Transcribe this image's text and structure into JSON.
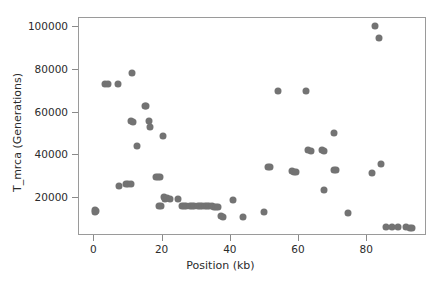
{
  "chart_data": {
    "type": "scatter",
    "title": "",
    "xlabel": "Position (kb)",
    "ylabel": "T_mrca (Generations)",
    "xlim": [
      -4.5,
      97.5
    ],
    "ylim": [
      2500,
      104000
    ],
    "xticks": [
      0,
      20,
      40,
      60,
      80
    ],
    "xticklabels": [
      "0",
      "20",
      "40",
      "60",
      "80"
    ],
    "yticks": [
      20000,
      40000,
      60000,
      80000,
      100000
    ],
    "yticklabels": [
      "20000",
      "40000",
      "60000",
      "80000",
      "100000"
    ],
    "grid": false,
    "legend": null,
    "marker_color": "#737373",
    "marker_size": 7,
    "series": [
      {
        "name": "T_mrca",
        "points": [
          [
            0.2,
            14800
          ],
          [
            0.3,
            13900
          ],
          [
            0.5,
            14200
          ],
          [
            3.2,
            73300
          ],
          [
            4.1,
            73200
          ],
          [
            6.8,
            73300
          ],
          [
            7.1,
            25800
          ],
          [
            9.4,
            26600
          ],
          [
            10.0,
            26700
          ],
          [
            10.6,
            26600
          ],
          [
            10.9,
            78300
          ],
          [
            10.8,
            55900
          ],
          [
            11.3,
            55700
          ],
          [
            12.6,
            44200
          ],
          [
            14.8,
            63200
          ],
          [
            15.1,
            62900
          ],
          [
            15.9,
            56200
          ],
          [
            16.4,
            53200
          ],
          [
            18.0,
            30000
          ],
          [
            18.6,
            29900
          ],
          [
            19.2,
            30000
          ],
          [
            19.0,
            16700
          ],
          [
            19.4,
            16500
          ],
          [
            20.2,
            49000
          ],
          [
            20.4,
            20700
          ],
          [
            20.6,
            19900
          ],
          [
            21.2,
            20000
          ],
          [
            22.2,
            19800
          ],
          [
            24.6,
            19900
          ],
          [
            25.6,
            16600
          ],
          [
            26.2,
            16500
          ],
          [
            26.8,
            16500
          ],
          [
            28.1,
            16400
          ],
          [
            28.7,
            16400
          ],
          [
            29.3,
            16400
          ],
          [
            30.4,
            16400
          ],
          [
            31.0,
            16300
          ],
          [
            31.6,
            16300
          ],
          [
            32.4,
            16300
          ],
          [
            33.0,
            16300
          ],
          [
            33.6,
            16300
          ],
          [
            34.4,
            16300
          ],
          [
            35.0,
            16200
          ],
          [
            35.6,
            16200
          ],
          [
            36.2,
            16200
          ],
          [
            37.1,
            11600
          ],
          [
            37.8,
            11500
          ],
          [
            40.6,
            19200
          ],
          [
            43.6,
            11400
          ],
          [
            49.6,
            13800
          ],
          [
            50.8,
            34700
          ],
          [
            51.6,
            34700
          ],
          [
            53.8,
            70200
          ],
          [
            57.9,
            32600
          ],
          [
            58.6,
            32500
          ],
          [
            59.2,
            32500
          ],
          [
            61.9,
            70100
          ],
          [
            62.6,
            42400
          ],
          [
            63.4,
            42200
          ],
          [
            66.7,
            42400
          ],
          [
            67.4,
            42300
          ],
          [
            67.2,
            24000
          ],
          [
            70.2,
            50600
          ],
          [
            70.1,
            33400
          ],
          [
            70.8,
            33300
          ],
          [
            74.2,
            13000
          ],
          [
            81.5,
            31700
          ],
          [
            82.4,
            100400
          ],
          [
            83.5,
            94600
          ],
          [
            84.0,
            36000
          ],
          [
            85.4,
            6600
          ],
          [
            87.3,
            6600
          ],
          [
            89.1,
            6500
          ],
          [
            91.2,
            6500
          ],
          [
            92.5,
            6400
          ],
          [
            93.1,
            6400
          ]
        ]
      }
    ]
  }
}
